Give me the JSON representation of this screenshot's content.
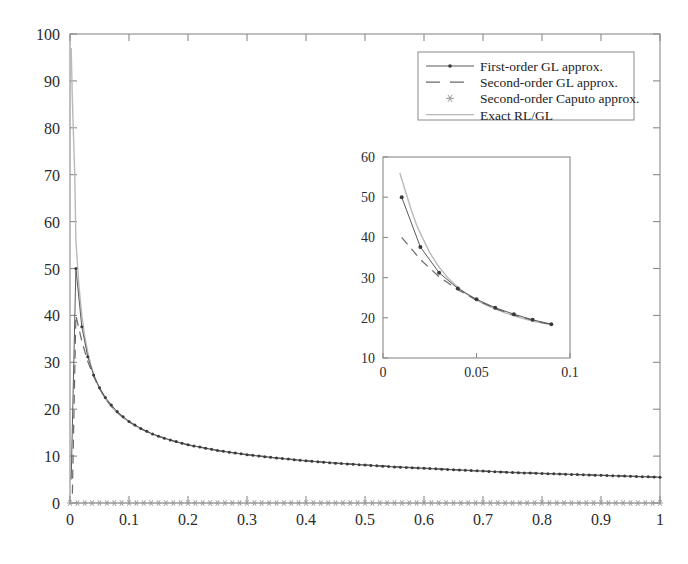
{
  "chart_data": {
    "type": "line",
    "title": "",
    "xlabel": "",
    "ylabel": "",
    "xlim": [
      0,
      1
    ],
    "ylim": [
      0,
      100
    ],
    "xticks": [
      "0",
      "0.1",
      "0.2",
      "0.3",
      "0.4",
      "0.5",
      "0.6",
      "0.7",
      "0.8",
      "0.9",
      "1"
    ],
    "xtick_values": [
      0,
      0.1,
      0.2,
      0.3,
      0.4,
      0.5,
      0.6,
      0.7,
      0.8,
      0.9,
      1
    ],
    "yticks": [
      "0",
      "10",
      "20",
      "30",
      "40",
      "50",
      "60",
      "70",
      "80",
      "90",
      "100"
    ],
    "ytick_values": [
      0,
      10,
      20,
      30,
      40,
      50,
      60,
      70,
      80,
      90,
      100
    ],
    "grid": false,
    "legend_position": "top-right",
    "legend": [
      {
        "label": "First-order GL approx.",
        "style": "line-with-dot-marker",
        "color": "#5a5a5a"
      },
      {
        "label": "Second-order GL approx.",
        "style": "dashed-line",
        "color": "#6a6a6a"
      },
      {
        "label": "Second-order Caputo approx.",
        "style": "star-marker",
        "color": "#9a9a9a"
      },
      {
        "label": "Exact RL/GL",
        "style": "solid-light-line",
        "color": "#b9b9b9"
      }
    ],
    "series": [
      {
        "name": "Exact RL/GL",
        "x": [
          0.002,
          0.004,
          0.006,
          0.008,
          0.01,
          0.015,
          0.02,
          0.025,
          0.03,
          0.035,
          0.04,
          0.045,
          0.05,
          0.06,
          0.07,
          0.08,
          0.09,
          0.1,
          0.12,
          0.14,
          0.16,
          0.18,
          0.2,
          0.25,
          0.3,
          0.35,
          0.4,
          0.45,
          0.5,
          0.55,
          0.6,
          0.65,
          0.7,
          0.75,
          0.8,
          0.85,
          0.9,
          0.95,
          1.0
        ],
        "y": [
          97.0,
          86.0,
          78.0,
          70.5,
          56.0,
          46.5,
          40.0,
          35.6,
          32.2,
          29.6,
          27.5,
          25.8,
          24.4,
          22.2,
          20.5,
          19.2,
          18.2,
          17.3,
          15.8,
          14.7,
          13.8,
          13.0,
          12.4,
          11.2,
          10.3,
          9.6,
          9.0,
          8.5,
          8.1,
          7.7,
          7.4,
          7.1,
          6.8,
          6.5,
          6.3,
          6.1,
          5.9,
          5.7,
          5.5
        ]
      },
      {
        "name": "First-order GL approx.",
        "x": [
          0.01,
          0.02,
          0.03,
          0.04,
          0.05,
          0.06,
          0.07,
          0.08,
          0.09,
          0.1,
          0.12,
          0.14,
          0.16,
          0.18,
          0.2,
          0.25,
          0.3,
          0.35,
          0.4,
          0.45,
          0.5,
          0.55,
          0.6,
          0.65,
          0.7,
          0.75,
          0.8,
          0.85,
          0.9,
          0.95,
          1.0
        ],
        "y": [
          50.0,
          37.6,
          31.2,
          27.3,
          24.6,
          22.5,
          20.9,
          19.5,
          18.4,
          17.4,
          15.9,
          14.7,
          13.8,
          13.1,
          12.4,
          11.2,
          10.3,
          9.6,
          9.0,
          8.5,
          8.1,
          7.7,
          7.4,
          7.1,
          6.8,
          6.5,
          6.3,
          6.1,
          5.9,
          5.7,
          5.5
        ]
      },
      {
        "name": "Second-order GL approx.",
        "x": [
          0.01,
          0.02,
          0.03,
          0.04,
          0.05,
          0.06,
          0.07,
          0.08,
          0.09,
          0.1,
          0.12,
          0.14,
          0.16,
          0.18,
          0.2,
          0.25,
          0.3,
          0.35,
          0.4,
          0.45,
          0.5,
          0.6,
          0.7,
          0.8,
          0.9,
          1.0
        ],
        "y": [
          40.0,
          34.5,
          30.2,
          27.0,
          24.4,
          22.3,
          20.7,
          19.4,
          18.3,
          17.3,
          15.8,
          14.7,
          13.8,
          13.0,
          12.4,
          11.2,
          10.3,
          9.6,
          9.0,
          8.5,
          8.1,
          7.4,
          6.8,
          6.3,
          5.9,
          5.5
        ]
      },
      {
        "name": "Second-order Caputo approx.",
        "x": [
          0.0,
          0.02,
          0.04,
          0.06,
          0.08,
          0.1,
          0.12,
          0.14,
          0.16,
          0.18,
          0.2,
          0.22,
          0.24,
          0.26,
          0.28,
          0.3,
          0.32,
          0.34,
          0.36,
          0.38,
          0.4,
          0.42,
          0.44,
          0.46,
          0.48,
          0.5,
          0.52,
          0.54,
          0.56,
          0.58,
          0.6,
          0.62,
          0.64,
          0.66,
          0.68,
          0.7,
          0.72,
          0.74,
          0.76,
          0.78,
          0.8,
          0.82,
          0.84,
          0.86,
          0.88,
          0.9,
          0.92,
          0.94,
          0.96,
          0.98,
          1.0
        ],
        "y": [
          0,
          0,
          0,
          0,
          0,
          0,
          0,
          0,
          0,
          0,
          0,
          0,
          0,
          0,
          0,
          0,
          0,
          0,
          0,
          0,
          0,
          0,
          0,
          0,
          0,
          0,
          0,
          0,
          0,
          0,
          0,
          0,
          0,
          0,
          0,
          0,
          0,
          0,
          0,
          0,
          0,
          0,
          0,
          0,
          0,
          0,
          0,
          0,
          0,
          0,
          0
        ]
      }
    ],
    "inset": {
      "xlim": [
        0,
        0.1
      ],
      "ylim": [
        10,
        60
      ],
      "xticks": [
        "0",
        "0.05",
        "0.1"
      ],
      "xtick_values": [
        0,
        0.05,
        0.1
      ],
      "yticks": [
        "10",
        "20",
        "30",
        "40",
        "50",
        "60"
      ],
      "ytick_values": [
        10,
        20,
        30,
        40,
        50,
        60
      ],
      "series": [
        {
          "name": "Exact RL/GL",
          "x": [
            0.009,
            0.012,
            0.015,
            0.018,
            0.02,
            0.025,
            0.03,
            0.035,
            0.04,
            0.045,
            0.05,
            0.055,
            0.06,
            0.065,
            0.07,
            0.075,
            0.08,
            0.085,
            0.09
          ],
          "y": [
            56.0,
            51.5,
            47.0,
            43.0,
            41.0,
            36.2,
            32.6,
            29.8,
            27.6,
            25.8,
            24.4,
            23.2,
            22.2,
            21.3,
            20.5,
            19.8,
            19.2,
            18.7,
            18.4
          ]
        },
        {
          "name": "First-order GL approx.",
          "x": [
            0.01,
            0.02,
            0.03,
            0.04,
            0.05,
            0.06,
            0.07,
            0.08,
            0.09
          ],
          "y": [
            50.0,
            37.6,
            31.2,
            27.3,
            24.6,
            22.5,
            20.9,
            19.5,
            18.4
          ]
        },
        {
          "name": "Second-order GL approx.",
          "x": [
            0.01,
            0.02,
            0.03,
            0.04,
            0.05,
            0.06,
            0.07,
            0.08,
            0.09
          ],
          "y": [
            40.0,
            34.5,
            30.2,
            27.0,
            24.4,
            22.3,
            20.7,
            19.4,
            18.3
          ]
        }
      ]
    }
  }
}
